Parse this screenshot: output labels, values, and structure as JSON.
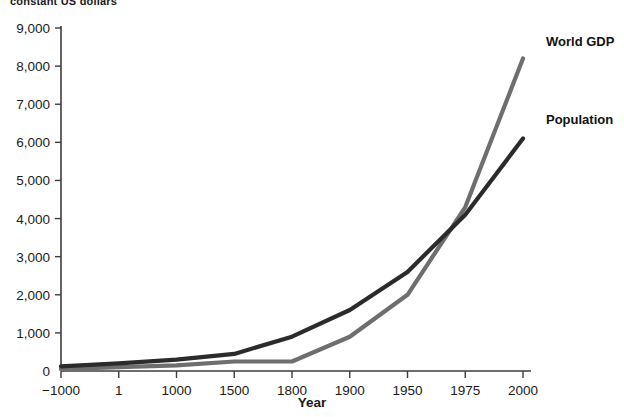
{
  "chart_data": {
    "type": "line",
    "title": "constant US dollars",
    "xlabel": "Year",
    "ylabel": "",
    "categories": [
      "-1000",
      "1",
      "1000",
      "1500",
      "1800",
      "1900",
      "1950",
      "1975",
      "2000"
    ],
    "ylim": [
      0,
      9000
    ],
    "yticks": [
      0,
      1000,
      2000,
      3000,
      4000,
      5000,
      6000,
      7000,
      8000,
      9000
    ],
    "ytick_labels": [
      "0",
      "1,000",
      "2,000",
      "3,000",
      "4,000",
      "5,000",
      "6,000",
      "7,000",
      "8,000",
      "9,000"
    ],
    "xtick_labels": [
      "−1000",
      "1",
      "1000",
      "1500",
      "1800",
      "1900",
      "1950",
      "1975",
      "2000"
    ],
    "grid": false,
    "legend_position": "inline-right",
    "series": [
      {
        "name": "World GDP",
        "color": "#6e6e6e",
        "values": [
          50,
          100,
          150,
          250,
          250,
          900,
          2000,
          4300,
          8200
        ]
      },
      {
        "name": "Population",
        "color": "#2b2b2b",
        "values": [
          120,
          200,
          300,
          450,
          900,
          1600,
          2600,
          4100,
          6100
        ]
      }
    ]
  },
  "labels": {
    "world_gdp": "World GDP",
    "population": "Population",
    "x_axis_title": "Year",
    "top_note": "constant US dollars"
  }
}
